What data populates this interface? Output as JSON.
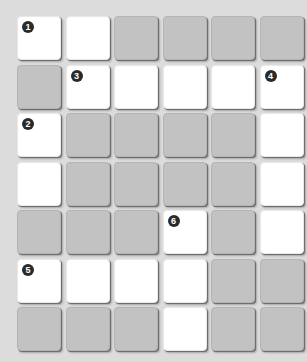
{
  "puzzle": {
    "rows": 7,
    "cols": 6,
    "colors": {
      "open": "#ffffff",
      "blocked": "#c2c2c2",
      "background": "#dcdcdc",
      "number_badge": "#2a2a2a"
    },
    "grid": [
      [
        "W",
        "W",
        "G",
        "G",
        "G",
        "G"
      ],
      [
        "G",
        "W",
        "W",
        "W",
        "W",
        "W"
      ],
      [
        "W",
        "G",
        "G",
        "G",
        "G",
        "W"
      ],
      [
        "W",
        "G",
        "G",
        "G",
        "G",
        "W"
      ],
      [
        "G",
        "G",
        "G",
        "W",
        "G",
        "W"
      ],
      [
        "W",
        "W",
        "W",
        "W",
        "G",
        "G"
      ],
      [
        "G",
        "G",
        "G",
        "W",
        "G",
        "G"
      ]
    ],
    "numbers": [
      {
        "row": 0,
        "col": 0,
        "label": "1"
      },
      {
        "row": 2,
        "col": 0,
        "label": "2"
      },
      {
        "row": 1,
        "col": 1,
        "label": "3"
      },
      {
        "row": 1,
        "col": 5,
        "label": "4"
      },
      {
        "row": 5,
        "col": 0,
        "label": "5"
      },
      {
        "row": 4,
        "col": 3,
        "label": "6"
      }
    ]
  }
}
